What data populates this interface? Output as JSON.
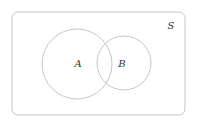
{
  "diagram": {
    "type": "venn",
    "universe": {
      "label": "S",
      "x": 12,
      "y": 12,
      "width": 173,
      "height": 103,
      "corner_radius": 6
    },
    "sets": [
      {
        "label": "A",
        "cx": 77,
        "cy": 64,
        "r": 35,
        "label_x": 78,
        "label_y": 67
      },
      {
        "label": "B",
        "cx": 124,
        "cy": 63,
        "r": 27,
        "label_x": 122,
        "label_y": 67
      }
    ],
    "universe_label_pos": {
      "x": 171,
      "y": 29
    },
    "colors": {
      "stroke": "#c6c6c6",
      "text": "#333333",
      "background": "#ffffff"
    }
  }
}
